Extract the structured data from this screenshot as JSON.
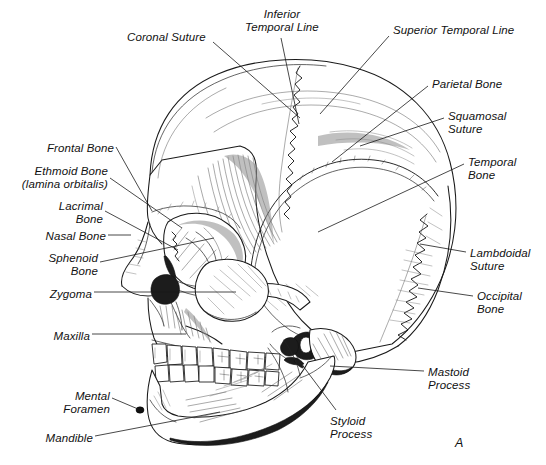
{
  "figure": {
    "panel_label": "A",
    "background_color": "#ffffff",
    "ink_color": "#1a1a1a",
    "view": "left lateral (norma lateralis)"
  },
  "labels": [
    {
      "id": "coronal-suture",
      "text": "Coronal Suture",
      "align": "left",
      "x": 127,
      "y": 31,
      "lines": [
        "Coronal Suture"
      ]
    },
    {
      "id": "inferior-temporal-line",
      "text": "Inferior\nTemporal Line",
      "align": "center",
      "x": 230,
      "y": 8,
      "lines": [
        "Inferior",
        "Temporal Line"
      ]
    },
    {
      "id": "superior-temporal-line",
      "text": "Superior Temporal Line",
      "align": "left",
      "x": 393,
      "y": 24,
      "lines": [
        "Superior Temporal Line"
      ]
    },
    {
      "id": "parietal-bone",
      "text": "Parietal Bone",
      "align": "left",
      "x": 432,
      "y": 78,
      "lines": [
        "Parietal Bone"
      ]
    },
    {
      "id": "squamosal-suture",
      "text": "Squamosal\nSuture",
      "align": "left",
      "x": 448,
      "y": 110,
      "lines": [
        "Squamosal",
        "Suture"
      ]
    },
    {
      "id": "temporal-bone",
      "text": "Temporal\nBone",
      "align": "left",
      "x": 468,
      "y": 156,
      "lines": [
        "Temporal",
        "Bone"
      ]
    },
    {
      "id": "lambdoidal-suture",
      "text": "Lambdoidal\nSuture",
      "align": "left",
      "x": 470,
      "y": 247,
      "lines": [
        "Lambdoidal",
        "Suture"
      ]
    },
    {
      "id": "occipital-bone",
      "text": "Occipital\nBone",
      "align": "left",
      "x": 477,
      "y": 290,
      "lines": [
        "Occipital",
        "Bone"
      ]
    },
    {
      "id": "mastoid-process",
      "text": "Mastoid\nProcess",
      "align": "left",
      "x": 428,
      "y": 366,
      "lines": [
        "Mastoid",
        "Process"
      ]
    },
    {
      "id": "styloid-process",
      "text": "Styloid\nProcess",
      "align": "left",
      "x": 330,
      "y": 415,
      "lines": [
        "Styloid",
        "Process"
      ]
    },
    {
      "id": "frontal-bone",
      "text": "Frontal Bone",
      "align": "right",
      "x": 38,
      "y": 142,
      "lines": [
        "Frontal Bone"
      ]
    },
    {
      "id": "ethmoid-bone",
      "text": "Ethmoid Bone\n(lamina orbitalis)",
      "align": "right",
      "x": 17,
      "y": 165,
      "lines": [
        "Ethmoid Bone",
        "(lamina orbitalis)"
      ]
    },
    {
      "id": "lacrimal-bone",
      "text": "Lacrimal\nBone",
      "align": "right",
      "x": 55,
      "y": 200,
      "lines": [
        "Lacrimal",
        "Bone"
      ]
    },
    {
      "id": "nasal-bone",
      "text": "Nasal Bone",
      "align": "right",
      "x": 40,
      "y": 230,
      "lines": [
        "Nasal Bone"
      ]
    },
    {
      "id": "sphenoid-bone",
      "text": "Sphenoid\nBone",
      "align": "right",
      "x": 43,
      "y": 252,
      "lines": [
        "Sphenoid",
        "Bone"
      ]
    },
    {
      "id": "zygoma",
      "text": "Zygoma",
      "align": "right",
      "x": 44,
      "y": 288,
      "lines": [
        "Zygoma"
      ]
    },
    {
      "id": "maxilla",
      "text": "Maxilla",
      "align": "right",
      "x": 48,
      "y": 330,
      "lines": [
        "Maxilla"
      ]
    },
    {
      "id": "mental-foramen",
      "text": "Mental\nForamen",
      "align": "right",
      "x": 56,
      "y": 390,
      "lines": [
        "Mental",
        "Foramen"
      ]
    },
    {
      "id": "mandible",
      "text": "Mandible",
      "align": "right",
      "x": 42,
      "y": 432,
      "lines": [
        "Mandible"
      ]
    }
  ],
  "leader_lines": [
    {
      "id": "coronal-suture-leader",
      "from": [
        213,
        42
      ],
      "to": [
        300,
        118
      ]
    },
    {
      "id": "inferior-temporal-line-leader",
      "from": [
        281,
        38
      ],
      "to": [
        299,
        124
      ]
    },
    {
      "id": "superior-temporal-line-leader",
      "from": [
        389,
        36
      ],
      "to": [
        320,
        114
      ]
    },
    {
      "id": "parietal-bone-leader",
      "from": [
        428,
        86
      ],
      "to": [
        332,
        162
      ]
    },
    {
      "id": "squamosal-suture-leader",
      "from": [
        444,
        118
      ],
      "to": [
        360,
        146
      ]
    },
    {
      "id": "temporal-bone-leader",
      "from": [
        464,
        164
      ],
      "to": [
        318,
        232
      ]
    },
    {
      "id": "lambdoidal-suture-leader",
      "from": [
        466,
        252
      ],
      "to": [
        420,
        244
      ]
    },
    {
      "id": "occipital-bone-leader",
      "from": [
        473,
        296
      ],
      "to": [
        418,
        288
      ]
    },
    {
      "id": "mastoid-process-leader",
      "from": [
        424,
        371
      ],
      "to": [
        330,
        366
      ]
    },
    {
      "id": "styloid-process-leader",
      "from": [
        336,
        410
      ],
      "to": [
        303,
        366
      ]
    },
    {
      "id": "frontal-bone-leader",
      "from": [
        116,
        147
      ],
      "to": [
        152,
        211
      ]
    },
    {
      "id": "ethmoid-bone-leader",
      "from": [
        110,
        178
      ],
      "to": [
        182,
        228
      ]
    },
    {
      "id": "lacrimal-bone-leader",
      "from": [
        105,
        211
      ],
      "to": [
        178,
        250
      ]
    },
    {
      "id": "nasal-bone-leader",
      "from": [
        108,
        235
      ],
      "to": [
        128,
        235
      ]
    },
    {
      "id": "sphenoid-bone-leader",
      "from": [
        100,
        262
      ],
      "to": [
        214,
        238
      ]
    },
    {
      "id": "zygoma-leader",
      "from": [
        94,
        292
      ],
      "to": [
        236,
        292
      ]
    },
    {
      "id": "maxilla-leader",
      "from": [
        92,
        334
      ],
      "to": [
        186,
        334
      ]
    },
    {
      "id": "mental-foramen-leader",
      "from": [
        112,
        398
      ],
      "to": [
        140,
        410
      ]
    },
    {
      "id": "mandible-leader",
      "from": [
        95,
        436
      ],
      "to": [
        220,
        412
      ]
    }
  ],
  "structures": [
    {
      "id": "cranial-vault",
      "name": "cranial vault / calvaria"
    },
    {
      "id": "frontal-bone",
      "name": "frontal bone"
    },
    {
      "id": "parietal-bone",
      "name": "parietal bone"
    },
    {
      "id": "temporal-bone",
      "name": "temporal bone (squama)"
    },
    {
      "id": "occipital-bone",
      "name": "occipital bone"
    },
    {
      "id": "coronal-suture",
      "name": "coronal suture"
    },
    {
      "id": "squamosal-suture",
      "name": "squamosal suture"
    },
    {
      "id": "lambdoidal-suture",
      "name": "lambdoidal suture"
    },
    {
      "id": "orbit",
      "name": "orbital cavity"
    },
    {
      "id": "nasal-aperture",
      "name": "piriform/nasal aperture"
    },
    {
      "id": "zygomatic-arch",
      "name": "zygomatic arch"
    },
    {
      "id": "maxilla",
      "name": "maxilla"
    },
    {
      "id": "mandible",
      "name": "mandible"
    },
    {
      "id": "upper-teeth",
      "name": "maxillary dentition"
    },
    {
      "id": "lower-teeth",
      "name": "mandibular dentition"
    },
    {
      "id": "mastoid-process",
      "name": "mastoid process"
    },
    {
      "id": "styloid-process",
      "name": "styloid process"
    },
    {
      "id": "mental-foramen",
      "name": "mental foramen"
    },
    {
      "id": "external-acoustic-meatus",
      "name": "external acoustic meatus"
    }
  ]
}
